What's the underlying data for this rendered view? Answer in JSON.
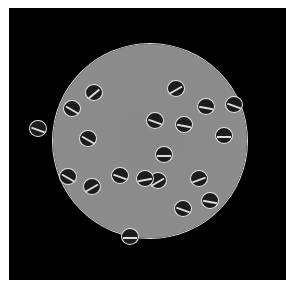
{
  "image": {
    "subject": "micrograph of circular dish with paired dividing cells",
    "background": "#000000",
    "dish_color": "#8a8a8a",
    "cells": [
      {
        "x": 176,
        "y": 88,
        "r": "-30deg"
      },
      {
        "x": 206,
        "y": 106,
        "r": "10deg"
      },
      {
        "x": 155,
        "y": 120,
        "r": "20deg"
      },
      {
        "x": 184,
        "y": 124,
        "r": "10deg"
      },
      {
        "x": 164,
        "y": 154,
        "r": "0deg"
      },
      {
        "x": 158,
        "y": 180,
        "r": "-30deg"
      },
      {
        "x": 199,
        "y": 178,
        "r": "-20deg"
      },
      {
        "x": 224,
        "y": 135,
        "r": "0deg"
      },
      {
        "x": 94,
        "y": 92,
        "r": "-40deg"
      },
      {
        "x": 72,
        "y": 108,
        "r": "30deg"
      },
      {
        "x": 38,
        "y": 128,
        "r": "20deg"
      },
      {
        "x": 88,
        "y": 138,
        "r": "30deg"
      },
      {
        "x": 120,
        "y": 175,
        "r": "20deg"
      },
      {
        "x": 145,
        "y": 178,
        "r": "-10deg"
      },
      {
        "x": 68,
        "y": 176,
        "r": "30deg"
      },
      {
        "x": 92,
        "y": 186,
        "r": "-30deg"
      },
      {
        "x": 183,
        "y": 208,
        "r": "20deg"
      },
      {
        "x": 130,
        "y": 236,
        "r": "0deg"
      },
      {
        "x": 210,
        "y": 200,
        "r": "10deg"
      },
      {
        "x": 234,
        "y": 104,
        "r": "20deg"
      }
    ]
  }
}
